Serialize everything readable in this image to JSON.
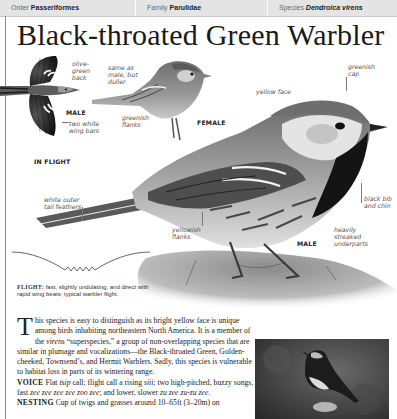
{
  "taxonomy": {
    "order": {
      "label": "Order",
      "value": "Passeriformes"
    },
    "family": {
      "label": "Family",
      "value": "Parulidae"
    },
    "species": {
      "label": "Species",
      "value": "Dendroica virens"
    }
  },
  "title": "Black-throated Green Warbler",
  "illustrations": {
    "in_flight": {
      "caption": "IN FLIGHT",
      "sex_tag": "MALE",
      "annotations": {
        "back": "olive-green back",
        "wing_bars": "two white wing bars"
      }
    },
    "female": {
      "caption": "FEMALE",
      "annotations": {
        "overall": "same as male, but duller",
        "flanks": "greenish flanks"
      }
    },
    "male": {
      "caption": "MALE",
      "annotations": {
        "cap": "greenish cap",
        "face": "yellow face",
        "bib": "black bib and chin",
        "underparts": "heavily streaked underparts",
        "flanks": "yellowish flanks",
        "tail": "white outer tail feathers"
      }
    }
  },
  "flight": {
    "label": "FLIGHT:",
    "text": "fast, slightly undulating, and direct with rapid wing beats; typical warbler flight."
  },
  "description": {
    "dropcap": "T",
    "intro_a": "his species is easy to distinguish as its bright yellow face is unique among birds inhabiting northeastern North America. It is a member of the ",
    "intro_em": "virens",
    "intro_b": " “superspecies,” a group of non-overlapping species that are similar in plumage and vocalizations—the Black-throated Green, Golden-cheeked, Townsend’s, and Hermit Warblers. Sadly, this species is vulnerable to habitat loss in parts of its wintering range.",
    "voice_label": "VOICE",
    "voice_a": " Flat ",
    "voice_em1": "tsip",
    "voice_b": " call; flight call a rising ",
    "voice_em2": "siii",
    "voice_c": "; two high-pitched, buzzy songs, fast ",
    "voice_em3": "zee zee zee zee zoo zee",
    "voice_d": "; and lower, slower ",
    "voice_em4": "zu zee zu-zu zee.",
    "nesting_label": "NESTING",
    "nesting_text": " Cup of twigs and grasses around 10–65ft (3–20m) on"
  }
}
